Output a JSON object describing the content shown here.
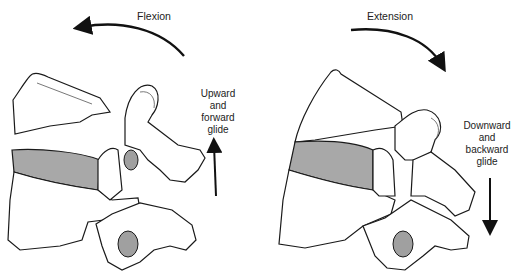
{
  "diagram": {
    "panels": [
      {
        "id": "flexion",
        "title": "Flexion",
        "motion_arrow": "counterclockwise-curved-arrow",
        "glide_label": [
          "Upward",
          "and",
          "forward",
          "glide"
        ],
        "glide_arrow": "arrow-up"
      },
      {
        "id": "extension",
        "title": "Extension",
        "motion_arrow": "clockwise-curved-arrow",
        "glide_label": [
          "Downward",
          "and",
          "backward",
          "glide"
        ],
        "glide_arrow": "arrow-down"
      }
    ],
    "colors": {
      "outline": "#1a1a1a",
      "disc_fill": "#a8a8a8",
      "facet_fill": "#a0a0a0",
      "shadow_fill": "#cfcfcf",
      "background": "#ffffff"
    }
  }
}
